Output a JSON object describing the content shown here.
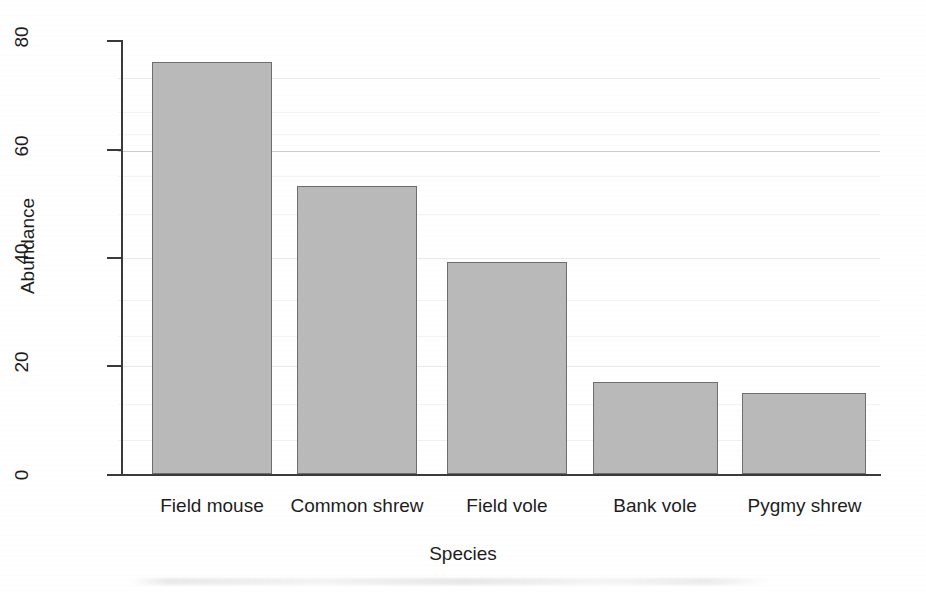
{
  "chart_data": {
    "type": "bar",
    "title": "",
    "subtitle": "",
    "xlabel": "Species",
    "ylabel": "Abundance",
    "categories": [
      "Field mouse",
      "Common shrew",
      "Field vole",
      "Bank vole",
      "Pygmy shrew"
    ],
    "values": [
      76,
      53,
      39,
      17,
      15
    ],
    "ylim": [
      0,
      80
    ],
    "yticks": [
      0,
      20,
      40,
      60,
      80
    ],
    "ytick_labels": [
      "0",
      "20",
      "40",
      "60",
      "80"
    ],
    "grid": false,
    "legend": null,
    "bar_fill_color": "#b9b9b9",
    "bar_edge_color": "#6e6e6e",
    "axis_color": "#3a3a3a",
    "background_color": "#ffffff"
  },
  "axis": {
    "y_title": "Abundance",
    "x_title": "Species"
  }
}
